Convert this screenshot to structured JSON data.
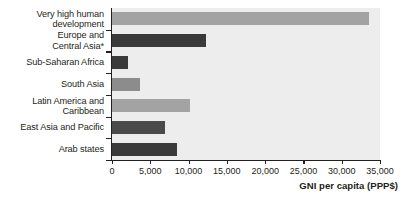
{
  "chart_data": {
    "type": "bar",
    "orientation": "horizontal",
    "title": "",
    "xlabel": "GNI per capita (PPP$)",
    "ylabel": "",
    "xlim": [
      0,
      35000
    ],
    "xticks": [
      0,
      5000,
      10000,
      15000,
      20000,
      25000,
      30000,
      35000
    ],
    "xtick_labels": [
      "0",
      "5,000",
      "10,000",
      "15,000",
      "20,000",
      "25,000",
      "30,000",
      "35,000"
    ],
    "grid": false,
    "legend": "none",
    "categories": [
      "Very high human\ndevelopment",
      "Europe and\nCentral Asia*",
      "Sub-Saharan Africa",
      "South Asia",
      "Latin America and\nCaribbean",
      "East Asia and Pacific",
      "Arab states"
    ],
    "values": [
      33600,
      12300,
      2100,
      3600,
      10200,
      6900,
      8500
    ],
    "bar_colors": [
      "#a3a3a3",
      "#3a3a3a",
      "#3a3a3a",
      "#8c8c8c",
      "#a3a3a3",
      "#4a4a4a",
      "#3a3a3a"
    ],
    "plot_background": "#ededed",
    "axis_color": "#231f20"
  },
  "footnote": {
    "asterisk_marker": "*"
  }
}
